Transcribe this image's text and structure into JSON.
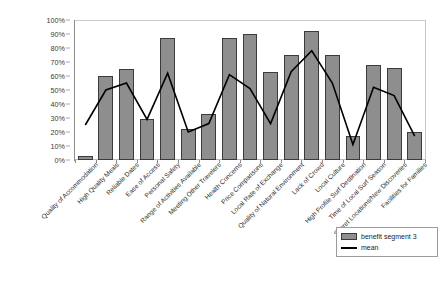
{
  "chart_data": {
    "type": "bar",
    "title": "",
    "xlabel": "",
    "ylabel": "",
    "ylim": [
      0,
      100
    ],
    "ytick_labels": [
      "100%",
      "90%",
      "80%",
      "70%",
      "60%",
      "50%",
      "40%",
      "30%",
      "20%",
      "10%",
      "0%"
    ],
    "ytick_values": [
      100,
      90,
      80,
      70,
      60,
      50,
      40,
      30,
      20,
      10,
      0
    ],
    "grid": false,
    "legend_position": "bottom-right",
    "categories": [
      "Quality of Accommodation",
      "High Quality Meals",
      "Reliable Dates",
      "Ease of Access",
      "Personal Safety",
      "Range of Activities Available",
      "Meeting Other Travelers",
      "Health Concerns",
      "Price Comparisons",
      "Local Rate of Exchange",
      "Quality of Natural Environment",
      "Lack of Crowd",
      "Local Culture",
      "High Profile Surf Destination",
      "Time of Local Surf Season",
      "Secret Locations/New Discoveries",
      "Facilities for Families"
    ],
    "series": [
      {
        "name": "benefit segment 3",
        "type": "bar",
        "color": "#8e8e8e",
        "values": [
          3,
          60,
          65,
          29,
          87,
          22,
          33,
          87,
          90,
          63,
          75,
          92,
          75,
          17,
          68,
          66,
          20
        ]
      },
      {
        "name": "mean",
        "type": "line",
        "color": "#000000",
        "values": [
          25,
          50,
          55,
          29,
          62,
          20,
          26,
          61,
          51,
          26,
          63,
          78,
          55,
          11,
          52,
          46,
          17
        ]
      }
    ]
  },
  "legend": {
    "items": [
      {
        "label": "benefit segment 3",
        "marker": "bar-swatch"
      },
      {
        "label": "mean",
        "marker": "line-swatch"
      }
    ]
  }
}
